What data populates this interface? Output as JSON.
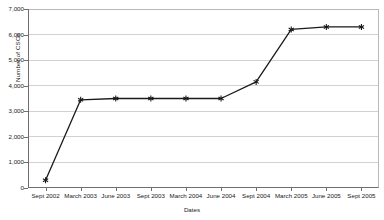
{
  "chart_data": {
    "type": "line",
    "title": "",
    "xlabel": "Dates",
    "ylabel": "Number of CSOs",
    "categories": [
      "Sept 2002",
      "March 2003",
      "June 2003",
      "Sept 2003",
      "March 2004",
      "June 2004",
      "Sept 2004",
      "March 2005",
      "June 2005",
      "Sept 2005"
    ],
    "values": [
      300,
      3450,
      3500,
      3500,
      3500,
      3500,
      4150,
      6200,
      6300,
      6300
    ],
    "series": [
      {
        "name": "Number of CSOs",
        "values": [
          300,
          3450,
          3500,
          3500,
          3500,
          3500,
          4150,
          6200,
          6300,
          6300
        ]
      }
    ],
    "ylim": [
      0,
      7000
    ],
    "ytick_values": [
      0,
      1000,
      2000,
      3000,
      4000,
      5000,
      6000,
      7000
    ],
    "ytick_labels": [
      "0",
      "1,000",
      "2,000",
      "3,000",
      "4,000",
      "5,000",
      "6,000",
      "7,000"
    ],
    "grid": true,
    "legend": false,
    "marker": "asterisk",
    "line_color": "#1a1a1a",
    "grid_color": "#d2d2d2",
    "axis_color": "#6f6f6f",
    "background_color": "#ffffff"
  }
}
